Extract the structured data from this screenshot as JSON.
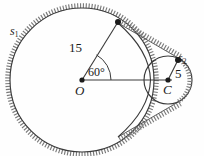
{
  "figure": {
    "type": "geometry-diagram",
    "background_color": "#fefefe",
    "stroke_color": "#3a3a3a",
    "hatch_color": "#6f6f6f"
  },
  "labels": {
    "circle_large": "s",
    "circle_large_sub": "1",
    "circle_small": "s",
    "circle_small_sub": "2",
    "radius_large": "15",
    "radius_small": "5",
    "angle": "60°",
    "center_large": "O",
    "center_small": "C"
  },
  "geometry": {
    "center_large": {
      "x": 82,
      "y": 80,
      "label": "O"
    },
    "center_small": {
      "x": 168,
      "y": 80,
      "label": "C"
    },
    "radius_large_px": 72,
    "radius_small_px": 24,
    "radius_value_large": 15,
    "radius_value_small": 5,
    "angle_degrees": 60,
    "point_on_large": {
      "x": 118,
      "y": 18
    },
    "point_on_small": {
      "x": 178,
      "y": 60
    }
  }
}
